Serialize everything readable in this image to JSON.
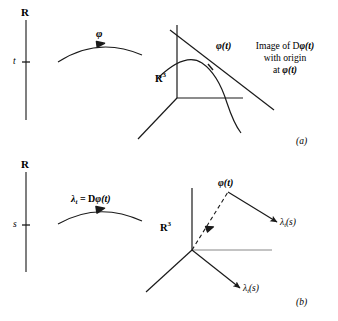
{
  "figure": {
    "title_alt": "Curve in R^3 and its derivative",
    "background_color": "#ffffff",
    "ink_color": "#1a1a1a"
  },
  "panel_a": {
    "panel_label": "(a)",
    "domain_axis": {
      "top_label": "R",
      "point_label": "t"
    },
    "map_arrow_label": "φ",
    "target_space_label": "R",
    "target_space_exponent": "3",
    "point_on_curve_label": "φ(t)",
    "caption_line1_prefix": "Image of D",
    "caption_line1_math": "φ(t)",
    "caption_line2": "with origin",
    "caption_line3_prefix": "at ",
    "caption_line3_math": "φ(t)"
  },
  "panel_b": {
    "panel_label": "(b)",
    "domain_axis": {
      "top_label": "R",
      "point_label": "s"
    },
    "map_arrow_lambda": "λ",
    "map_arrow_lambda_sub": "t",
    "map_arrow_equals": " = D",
    "map_arrow_phi": "φ(t)",
    "target_space_label": "R",
    "target_space_exponent": "3",
    "point_label": "φ(t)",
    "vector_right": {
      "symbol": "λ",
      "subscript": "t",
      "argument": "(s)"
    },
    "vector_down": {
      "symbol": "λ",
      "subscript": "t",
      "argument": "(s)"
    }
  }
}
